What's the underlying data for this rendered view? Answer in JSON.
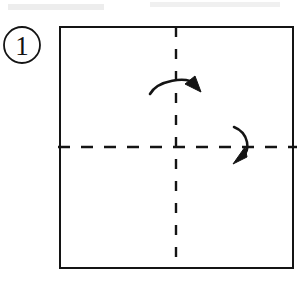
{
  "diagram": {
    "background_color": "#ffffff",
    "ink_color": "#141414",
    "step_label": "1",
    "step_badge": {
      "shape": "circle",
      "cx": 22,
      "cy": 45,
      "r": 18,
      "stroke_width": 1.8
    },
    "paper": {
      "name": "square-sheet",
      "x": 60,
      "y": 27,
      "width": 233,
      "height": 241,
      "stroke_width": 2.2,
      "fill": "#ffffff"
    },
    "creases": [
      {
        "name": "vertical-crease",
        "orientation": "vertical",
        "x1": 176,
        "y1": 27,
        "x2": 176,
        "y2": 268,
        "style": "dashed",
        "dash": "10 12",
        "stroke_width": 2.4
      },
      {
        "name": "horizontal-crease",
        "orientation": "horizontal",
        "x1": 58,
        "y1": 147,
        "x2": 297,
        "y2": 147,
        "style": "dashed",
        "dash": "12 11",
        "stroke_width": 2.4
      }
    ],
    "arrows": [
      {
        "name": "fold-arrow-top",
        "meaning": "fold-right-half-over-vertical-crease",
        "path": "M 150 94 C 158 80 186 76 197 85",
        "head_points": "199 91, 186 84, 194 79",
        "stroke_width": 2.6
      },
      {
        "name": "fold-arrow-right",
        "meaning": "fold-bottom-half-over-horizontal-crease",
        "path": "M 235 128 C 249 134 250 152 240 158",
        "head_points": "235 163, 246 156, 244 149",
        "stroke_width": 2.6
      }
    ],
    "scan_artifacts": [
      {
        "name": "scan-smudge-top-left",
        "x": 8,
        "y": 4,
        "width": 96,
        "height": 6,
        "opacity": 0.07
      },
      {
        "name": "scan-smudge-top-right",
        "x": 150,
        "y": 2,
        "width": 130,
        "height": 5,
        "opacity": 0.06
      }
    ]
  }
}
